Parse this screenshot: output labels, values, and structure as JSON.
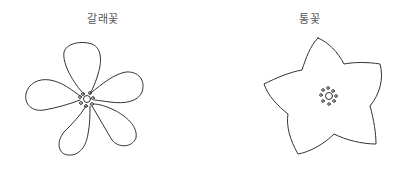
{
  "diagram": {
    "left": {
      "label": "갈래꽃",
      "shape": "separate-petal flower with 5 distinct petals",
      "petal_count": 5
    },
    "right": {
      "label": "통꽃",
      "shape": "fused-petal flower with 5 lobes",
      "lobe_count": 5
    },
    "colors": {
      "stroke": "#333333",
      "label": "#555555",
      "background": "#ffffff"
    }
  }
}
